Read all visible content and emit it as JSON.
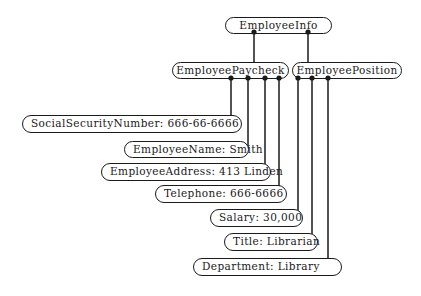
{
  "diagram": {
    "root": {
      "label": "EmployeeInfo"
    },
    "groups": [
      {
        "label": "EmployeePaycheck",
        "fields": [
          {
            "label": "SocialSecurityNumber: 666-66-6666"
          },
          {
            "label": "EmployeeName: Smith"
          },
          {
            "label": "EmployeeAddress: 413 Linden"
          },
          {
            "label": "Telephone: 666-6666"
          }
        ]
      },
      {
        "label": "EmployeePosition",
        "fields": [
          {
            "label": "Salary: 30,000"
          },
          {
            "label": "Title: Librarian"
          },
          {
            "label": "Department: Library"
          }
        ]
      }
    ],
    "colors": {
      "stroke": "#1a1a1a",
      "background": "#ffffff"
    }
  }
}
